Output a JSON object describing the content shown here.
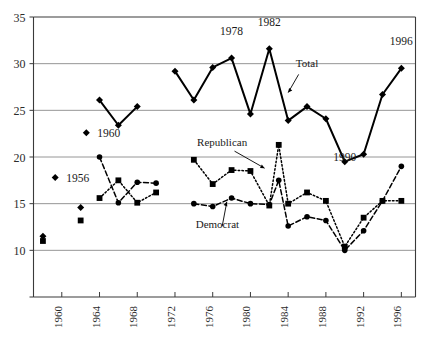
{
  "chart_data": {
    "type": "line",
    "title": "",
    "subtitle": "",
    "xlabel": "",
    "ylabel": "",
    "xlim": [
      1957,
      1997.5
    ],
    "ylim": [
      5,
      35
    ],
    "yticks": [
      5,
      10,
      15,
      20,
      25,
      30,
      35
    ],
    "ytick_labels": [
      "",
      "10",
      "15",
      "20",
      "25",
      "30",
      "35"
    ],
    "gridlines_y": [
      10,
      15,
      20,
      25,
      30
    ],
    "grid": true,
    "legend_position": "inline-annotations",
    "xticks": [
      1960,
      1964,
      1968,
      1972,
      1976,
      1980,
      1984,
      1988,
      1992,
      1996
    ],
    "xtick_labels": [
      "1960",
      "1964",
      "1968",
      "1972",
      "1976",
      "1980",
      "1984",
      "1988",
      "1992",
      "1996"
    ],
    "series": [
      {
        "name": "Total",
        "marker": "diamond",
        "line_style": "solid",
        "color": "#000000",
        "segments": [
          {
            "x": [
              1964,
              1966,
              1968
            ],
            "y": [
              26.1,
              23.4,
              25.4
            ]
          },
          {
            "x": [
              1972,
              1974,
              1976,
              1978,
              1980,
              1982,
              1984,
              1986,
              1988,
              1990,
              1992,
              1994,
              1996
            ],
            "y": [
              29.2,
              26.1,
              29.6,
              30.6,
              24.6,
              31.6,
              23.9,
              25.4,
              24.1,
              19.5,
              20.3,
              26.7,
              29.5
            ]
          }
        ],
        "isolated_points": [
          {
            "x": 1958,
            "y": 11.5
          },
          {
            "x": 1962,
            "y": 14.6
          }
        ]
      },
      {
        "name": "Republican",
        "marker": "square",
        "line_style": "dotted",
        "color": "#000000",
        "segments": [
          {
            "x": [
              1964,
              1966,
              1968,
              1970
            ],
            "y": [
              15.6,
              17.5,
              15.1,
              16.2
            ]
          },
          {
            "x": [
              1974,
              1976,
              1978,
              1980,
              1982,
              1983,
              1984,
              1986,
              1988,
              1990,
              1992,
              1994,
              1996
            ],
            "y": [
              19.7,
              17.1,
              18.6,
              18.5,
              14.8,
              21.3,
              15.0,
              16.2,
              15.3,
              10.4,
              13.5,
              15.3,
              15.3
            ]
          }
        ],
        "isolated_points": [
          {
            "x": 1958,
            "y": 11.0
          },
          {
            "x": 1962,
            "y": 13.2
          }
        ]
      },
      {
        "name": "Democrat",
        "marker": "circle",
        "line_style": "dashed",
        "color": "#000000",
        "segments": [
          {
            "x": [
              1964,
              1966,
              1968,
              1970
            ],
            "y": [
              20.0,
              15.1,
              17.3,
              17.2
            ]
          },
          {
            "x": [
              1974,
              1976,
              1978,
              1980,
              1982,
              1983,
              1984,
              1986,
              1988,
              1990,
              1992,
              1994,
              1996
            ],
            "y": [
              15.0,
              14.7,
              15.6,
              15.0,
              14.9,
              17.5,
              12.6,
              13.6,
              13.2,
              10.0,
              12.1,
              15.3,
              19.0
            ]
          }
        ],
        "isolated_points": []
      }
    ],
    "annotations": [
      {
        "text": "1978",
        "x": 1978,
        "y": 33.1,
        "type": "year-label"
      },
      {
        "text": "1982",
        "x": 1982,
        "y": 34.0,
        "type": "year-label"
      },
      {
        "text": "1996",
        "x": 1996,
        "y": 32.0,
        "type": "year-label"
      },
      {
        "text": "1990",
        "x": 1990,
        "y": 19.6,
        "type": "year-label"
      },
      {
        "text": "Total",
        "x": 1986,
        "y": 29.6,
        "type": "series-callout",
        "points_to": [
          1984,
          26.9
        ]
      },
      {
        "text": "Republican",
        "x": 1977,
        "y": 21.2,
        "type": "series-callout",
        "points_to": [
          1981.5,
          18.8
        ]
      },
      {
        "text": "Democrat",
        "x": 1976.5,
        "y": 12.4,
        "type": "series-callout",
        "points_to": [
          1977.5,
          15.2
        ]
      }
    ],
    "legend_entries": [
      {
        "label": "1960",
        "marker": "diamond",
        "x": 1962.6,
        "y": 22.6
      },
      {
        "label": "1956",
        "marker": "diamond",
        "x": 1959.3,
        "y": 17.8
      }
    ]
  }
}
